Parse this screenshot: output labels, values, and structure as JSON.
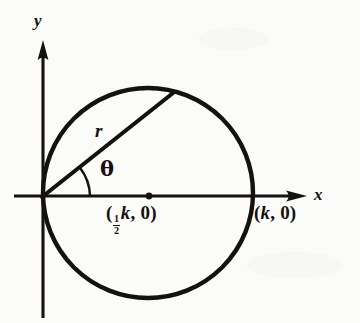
{
  "figure": {
    "kind": "polar-coordinate-circle-diagram",
    "background_color": "#fbfbfa",
    "ink_color": "#14110f"
  },
  "axes": {
    "x_label": "x",
    "y_label": "y",
    "origin": {
      "x": 42,
      "y": 197
    },
    "x_axis": {
      "start_x": 14,
      "end_x": 305,
      "arrow": "right"
    },
    "y_axis": {
      "start_y": 318,
      "end_y": 42,
      "arrow": "up"
    }
  },
  "circle": {
    "center": {
      "x": 148,
      "y": 193
    },
    "radius": 105,
    "passes_through_origin": true,
    "tangent_to": "y-axis"
  },
  "radius_line": {
    "from": {
      "x": 42,
      "y": 197
    },
    "to": {
      "x": 173,
      "y": 93
    },
    "label": "r",
    "angle_degrees": 38
  },
  "angle_arc": {
    "label": "θ",
    "vertex": {
      "x": 42,
      "y": 197
    },
    "radius": 48,
    "from_degrees": 0,
    "to_degrees": 38
  },
  "points": [
    {
      "name": "center-point",
      "label_parts": {
        "open": "(",
        "numerator": "1",
        "denominator": "2",
        "variable": "k",
        "rest": ", 0)"
      },
      "label_text": "(½k, 0)",
      "marker": {
        "x": 149,
        "y": 196,
        "radius": 3.4
      },
      "has_marker": true
    },
    {
      "name": "vertex-point",
      "label_text": "(k, 0)",
      "label_parts": {
        "open": "(",
        "variable": "k",
        "rest": ", 0)"
      },
      "marker": {
        "x": 253,
        "y": 195
      },
      "has_marker": false
    }
  ]
}
